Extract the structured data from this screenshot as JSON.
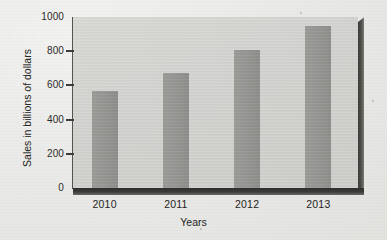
{
  "chart_data": {
    "type": "bar",
    "title": "",
    "subtitle": "",
    "xlabel": "Years",
    "ylabel": "Sales in billions of dollars",
    "categories": [
      "2010",
      "2011",
      "2012",
      "2013"
    ],
    "values": [
      570,
      670,
      810,
      950
    ],
    "series": [
      {
        "name": "Sales",
        "values": [
          570,
          670,
          810,
          950
        ]
      }
    ],
    "ylim": [
      0,
      1000
    ],
    "yticks": [
      0,
      200,
      400,
      600,
      800,
      1000
    ],
    "ytick_labels": [
      "0",
      "200",
      "400",
      "600",
      "800",
      "1000"
    ],
    "xtick_labels": [
      "2010",
      "2011",
      "2012",
      "2013"
    ],
    "grid": false,
    "legend": "none",
    "annotations": [],
    "style": {
      "bar_color": "#979794",
      "plot_background": "#d2d2cf",
      "page_background": "#e9e9e7",
      "axis_color": "#3d3d3a",
      "text_color": "#242423",
      "shadow_color": "#35352f",
      "three_d_edges": true
    }
  }
}
